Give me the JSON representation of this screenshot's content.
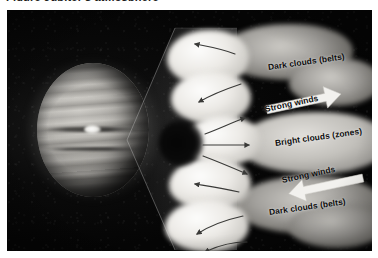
{
  "figure": {
    "clipped_caption_text": "Figure  Jupiter's atmosphere",
    "alt_title": "Jupiter cloud belts and zones cutaway"
  },
  "planet": {
    "name": "jupiter",
    "great_red_spot_label": ""
  },
  "labels": {
    "dark_clouds_top": "Dark clouds (belts)",
    "strong_winds_top": "Strong winds",
    "bright_clouds": "Bright clouds (zones)",
    "strong_winds_bottom": "Strong winds",
    "dark_clouds_bottom": "Dark clouds (belts)"
  },
  "arrows": {
    "big_right_direction": "right",
    "big_left_direction": "left",
    "flow_top_direction": "left",
    "flow_middle_direction": "right",
    "flow_bottom_direction": "left"
  },
  "colors": {
    "plate_background": "#060606",
    "label_text": "#0d0d0d",
    "big_arrow_fill": "#f2f1ee",
    "flow_arrow_stroke": "#3a3a38",
    "page_background": "#ffffff"
  }
}
